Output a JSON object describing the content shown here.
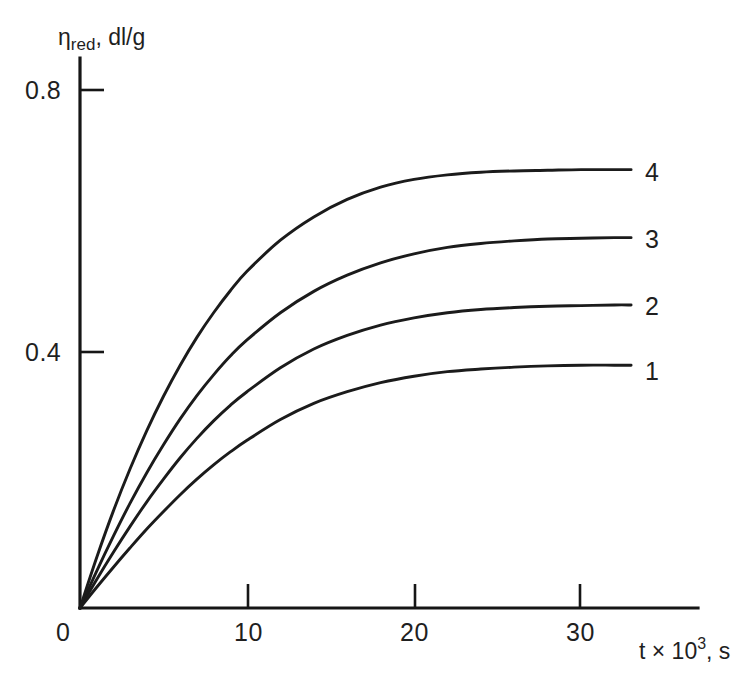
{
  "figure": {
    "background_color": "#ffffff",
    "ink_color": "#1b1b1b"
  },
  "axes": {
    "y_title_main": "η",
    "y_title_sub": "red",
    "y_title_rest": ", dl/g",
    "y_title_full": "ηred, dl/g",
    "x_title_main": "t × 10",
    "x_title_sup": "3",
    "x_title_rest": ", s",
    "x_title_full": "t × 10³, s",
    "origin_label": "0",
    "y_ticks": [
      "0.4",
      "0.8"
    ],
    "x_ticks": [
      "10",
      "20",
      "30"
    ]
  },
  "curve_labels": [
    "1",
    "2",
    "3",
    "4"
  ],
  "chart_data": {
    "type": "line",
    "title": "",
    "xlabel": "t × 10³, s",
    "ylabel": "ηred, dl/g",
    "xlim": [
      0,
      37
    ],
    "ylim": [
      0,
      0.85
    ],
    "xticks": [
      0,
      10,
      20,
      30
    ],
    "xticklabels": [
      "0",
      "10",
      "20",
      "30"
    ],
    "yticks": [
      0.4,
      0.8
    ],
    "yticklabels": [
      "0.4",
      "0.8"
    ],
    "grid": false,
    "legend": "inline-right-end-labels",
    "annotations": [
      {
        "text": "4",
        "x": 34.2,
        "y": 0.675
      },
      {
        "text": "3",
        "x": 34.2,
        "y": 0.572
      },
      {
        "text": "2",
        "x": 34.2,
        "y": 0.468
      },
      {
        "text": "1",
        "x": 34.2,
        "y": 0.368
      }
    ],
    "series": [
      {
        "name": "1",
        "plateau": 0.375,
        "x": [
          0,
          1,
          2,
          3,
          4,
          5,
          6,
          7,
          8,
          9,
          10,
          12,
          14,
          16,
          18,
          20,
          22,
          24,
          26,
          28,
          30,
          32,
          33
        ],
        "y": [
          0.0,
          0.032,
          0.063,
          0.093,
          0.122,
          0.149,
          0.175,
          0.199,
          0.221,
          0.241,
          0.259,
          0.291,
          0.316,
          0.334,
          0.348,
          0.358,
          0.365,
          0.369,
          0.372,
          0.374,
          0.375,
          0.375,
          0.375
        ]
      },
      {
        "name": "2",
        "plateau": 0.468,
        "x": [
          0,
          1,
          2,
          3,
          4,
          5,
          6,
          7,
          8,
          9,
          10,
          12,
          14,
          16,
          18,
          20,
          22,
          24,
          26,
          28,
          30,
          32,
          33
        ],
        "y": [
          0.0,
          0.044,
          0.086,
          0.126,
          0.164,
          0.199,
          0.232,
          0.262,
          0.289,
          0.313,
          0.334,
          0.371,
          0.4,
          0.421,
          0.437,
          0.448,
          0.456,
          0.461,
          0.464,
          0.466,
          0.467,
          0.468,
          0.468
        ]
      },
      {
        "name": "3",
        "plateau": 0.572,
        "x": [
          0,
          1,
          2,
          3,
          4,
          5,
          6,
          7,
          8,
          9,
          10,
          12,
          14,
          16,
          18,
          20,
          22,
          24,
          26,
          28,
          30,
          32,
          33
        ],
        "y": [
          0.0,
          0.057,
          0.111,
          0.162,
          0.209,
          0.252,
          0.292,
          0.328,
          0.36,
          0.389,
          0.414,
          0.456,
          0.489,
          0.514,
          0.533,
          0.547,
          0.557,
          0.563,
          0.567,
          0.57,
          0.571,
          0.572,
          0.572
        ]
      },
      {
        "name": "4",
        "plateau": 0.677,
        "x": [
          0,
          1,
          2,
          3,
          4,
          5,
          6,
          7,
          8,
          9,
          10,
          12,
          14,
          16,
          18,
          20,
          22,
          24,
          26,
          28,
          30,
          32,
          33
        ],
        "y": [
          0.0,
          0.078,
          0.15,
          0.215,
          0.274,
          0.327,
          0.375,
          0.418,
          0.456,
          0.49,
          0.52,
          0.568,
          0.604,
          0.631,
          0.65,
          0.662,
          0.669,
          0.673,
          0.675,
          0.676,
          0.677,
          0.677,
          0.677
        ]
      }
    ]
  },
  "geometry": {
    "origin_px": {
      "x": 80,
      "y": 608
    },
    "x_axis_end_px": 698,
    "y_axis_top_px": 58,
    "px_per_x_unit": 16.7,
    "px_per_y_unit": 647.5
  }
}
